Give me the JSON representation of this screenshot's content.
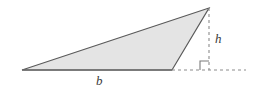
{
  "figure": {
    "background_color": "#ffffff",
    "labels": {
      "base": "b",
      "height": "h"
    },
    "colors": {
      "triangle_fill": "#e4e4e4",
      "triangle_stroke": "#5a5a5a",
      "base_line": "#6b6b6b",
      "dashed_line": "#8c8c8c",
      "right_angle_marker": "#7a7a7a",
      "label_text": "#3a3a3a"
    },
    "geometry": {
      "triangle_vertices": [
        {
          "name": "left-vertex",
          "x": 22,
          "y": 70
        },
        {
          "name": "bottom-right-vertex",
          "x": 172,
          "y": 70
        },
        {
          "name": "apex-vertex",
          "x": 209,
          "y": 8
        }
      ],
      "base_segment": {
        "x1": 22,
        "y1": 70,
        "x2": 172,
        "y2": 70
      },
      "height_dashed_segment": {
        "x1": 209,
        "y1": 8,
        "x2": 209,
        "y2": 70
      },
      "baseline_dashed_extension": {
        "x1": 172,
        "y1": 70,
        "x2": 246,
        "y2": 70
      },
      "right_angle_marker": {
        "x": 200,
        "y": 61,
        "size": 9
      },
      "dash_pattern": "3 3",
      "stroke_width": 1.2
    },
    "label_positions": {
      "base_label": {
        "x": 100,
        "y": 81
      },
      "height_label": {
        "x": 218,
        "y": 38
      }
    }
  }
}
